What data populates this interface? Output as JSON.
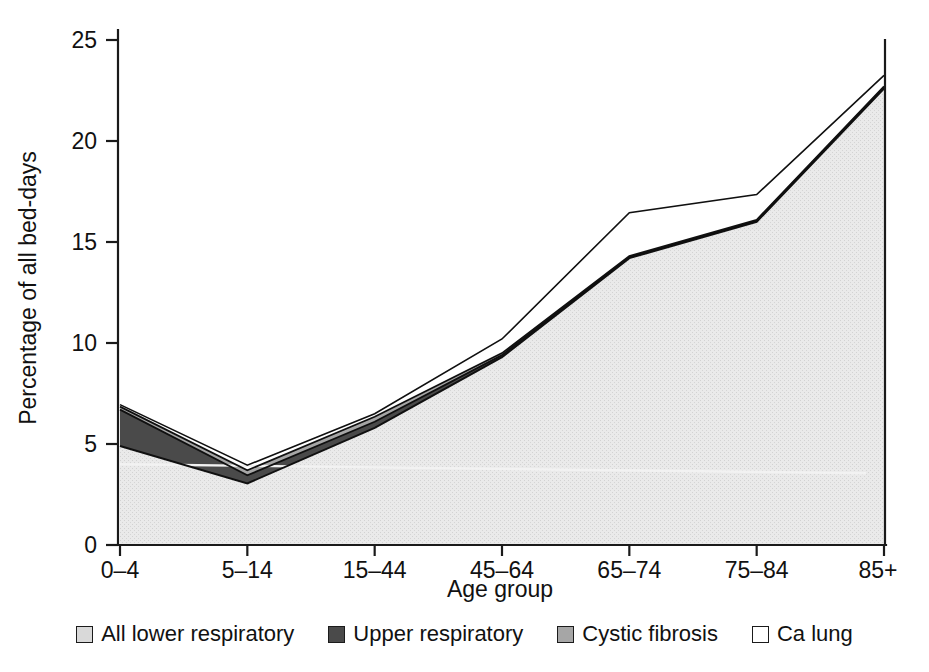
{
  "figure": {
    "background_color": "#ffffff",
    "axis_color": "#1a1a1a"
  },
  "chart_data": {
    "type": "area",
    "stacked": true,
    "title": "",
    "xlabel": "Age group",
    "ylabel": "Percentage of all bed-days",
    "categories": [
      "0–4",
      "5–14",
      "15–44",
      "45–64",
      "65–74",
      "75–84",
      "85+"
    ],
    "x_tick_labels": [
      "0–4",
      "5–14",
      "15–44",
      "45–64",
      "65–74",
      "75–84",
      "85+"
    ],
    "y_tick_labels": [
      "0",
      "5",
      "10",
      "15",
      "20",
      "25"
    ],
    "y_ticks": [
      0,
      5,
      10,
      15,
      20,
      25
    ],
    "ylim": [
      0,
      25
    ],
    "grid": false,
    "legend_position": "bottom",
    "series": [
      {
        "name": "All lower respiratory",
        "color": "#d9d9d9",
        "values": [
          4.9,
          3.05,
          5.8,
          9.3,
          14.2,
          16.0,
          22.6
        ]
      },
      {
        "name": "Upper respiratory",
        "color": "#4a4a4a",
        "values": [
          1.8,
          0.4,
          0.3,
          0.1,
          0.05,
          0.05,
          0.05
        ]
      },
      {
        "name": "Cystic fibrosis",
        "color": "#a6a6a6",
        "values": [
          0.15,
          0.25,
          0.25,
          0.1,
          0.05,
          0.05,
          0.05
        ]
      },
      {
        "name": "Ca lung",
        "color": "#ffffff",
        "values": [
          0.1,
          0.25,
          0.15,
          0.7,
          2.15,
          1.25,
          0.55
        ]
      }
    ],
    "cumulative_tops": [
      [
        4.9,
        3.05,
        5.8,
        9.3,
        14.2,
        16.0,
        22.6
      ],
      [
        6.7,
        3.45,
        6.1,
        9.4,
        14.25,
        16.05,
        22.65
      ],
      [
        6.85,
        3.7,
        6.35,
        9.5,
        14.3,
        16.1,
        22.7
      ],
      [
        6.95,
        3.95,
        6.5,
        10.2,
        16.45,
        17.35,
        23.25
      ]
    ]
  },
  "legend": {
    "items": [
      {
        "label": "All lower respiratory",
        "swatch_color": "#d9d9d9"
      },
      {
        "label": "Upper respiratory",
        "swatch_color": "#4a4a4a"
      },
      {
        "label": "Cystic fibrosis",
        "swatch_color": "#a6a6a6"
      },
      {
        "label": "Ca lung",
        "swatch_color": "#ffffff"
      }
    ]
  }
}
